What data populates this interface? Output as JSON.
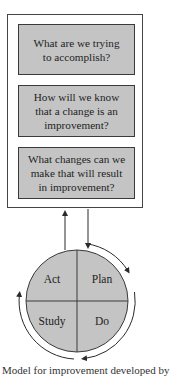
{
  "model_for_improvement": {
    "questions": [
      {
        "text_line1": "What are we trying",
        "text_line2": "to accomplish?",
        "text_line3": ""
      },
      {
        "text_line1": "How will we know",
        "text_line2": "that a change is an",
        "text_line3": "improvement?"
      },
      {
        "text_line1": "What changes can we",
        "text_line2": "make that will result",
        "text_line3": "in improvement?"
      }
    ],
    "pdsa_cycle": {
      "quadrants": {
        "top_left": "Act",
        "top_right": "Plan",
        "bottom_left": "Study",
        "bottom_right": "Do"
      }
    },
    "colors": {
      "box_fill": "#c4c4c4",
      "circle_fill": "#c4c4c4",
      "stroke": "#3a3a3a"
    }
  },
  "caption_cut": "Model for improvement developed by"
}
